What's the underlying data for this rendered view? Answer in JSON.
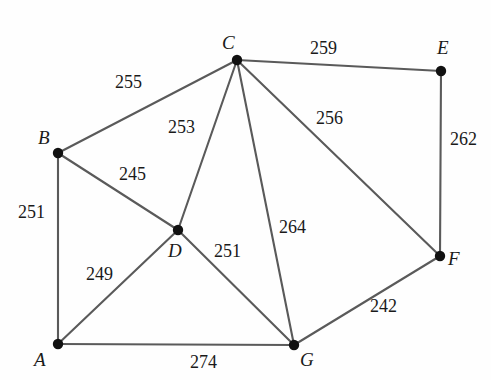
{
  "figure": {
    "kind": "weighted-undirected-graph",
    "background_color": "#fefefe",
    "edge_color": "#5a5a5a",
    "node_color": "#111111",
    "text_color": "#1a1a1a",
    "width": 491,
    "height": 380
  },
  "nodes": [
    {
      "id": "A",
      "label": "A",
      "x": 58,
      "y": 344,
      "label_x": 34,
      "label_y": 350
    },
    {
      "id": "B",
      "label": "B",
      "x": 58,
      "y": 153,
      "label_x": 38,
      "label_y": 128
    },
    {
      "id": "C",
      "label": "C",
      "x": 237,
      "y": 60,
      "label_x": 222,
      "label_y": 33
    },
    {
      "id": "D",
      "label": "D",
      "x": 178,
      "y": 230,
      "label_x": 168,
      "label_y": 241
    },
    {
      "id": "E",
      "label": "E",
      "x": 441,
      "y": 71,
      "label_x": 437,
      "label_y": 38
    },
    {
      "id": "F",
      "label": "F",
      "x": 440,
      "y": 256,
      "label_x": 448,
      "label_y": 249
    },
    {
      "id": "G",
      "label": "G",
      "x": 294,
      "y": 345,
      "label_x": 300,
      "label_y": 350
    }
  ],
  "edges": [
    {
      "id": "A-B",
      "from": "A",
      "to": "B",
      "weight": "251",
      "label_x": 18,
      "label_y": 203
    },
    {
      "id": "A-D",
      "from": "A",
      "to": "D",
      "weight": "249",
      "label_x": 86,
      "label_y": 265
    },
    {
      "id": "A-G",
      "from": "A",
      "to": "G",
      "weight": "274",
      "label_x": 190,
      "label_y": 353
    },
    {
      "id": "B-C",
      "from": "B",
      "to": "C",
      "weight": "255",
      "label_x": 115,
      "label_y": 73
    },
    {
      "id": "B-D",
      "from": "B",
      "to": "D",
      "weight": "245",
      "label_x": 119,
      "label_y": 165
    },
    {
      "id": "C-D",
      "from": "C",
      "to": "D",
      "weight": "253",
      "label_x": 168,
      "label_y": 118
    },
    {
      "id": "C-E",
      "from": "C",
      "to": "E",
      "weight": "259",
      "label_x": 310,
      "label_y": 39
    },
    {
      "id": "C-F",
      "from": "C",
      "to": "F",
      "weight": "256",
      "label_x": 316,
      "label_y": 109
    },
    {
      "id": "C-G",
      "from": "C",
      "to": "G",
      "weight": "264",
      "label_x": 279,
      "label_y": 218
    },
    {
      "id": "D-G",
      "from": "D",
      "to": "G",
      "weight": "251",
      "label_x": 214,
      "label_y": 242
    },
    {
      "id": "E-F",
      "from": "E",
      "to": "F",
      "weight": "262",
      "label_x": 450,
      "label_y": 130
    },
    {
      "id": "F-G",
      "from": "F",
      "to": "G",
      "weight": "242",
      "label_x": 370,
      "label_y": 297
    }
  ]
}
